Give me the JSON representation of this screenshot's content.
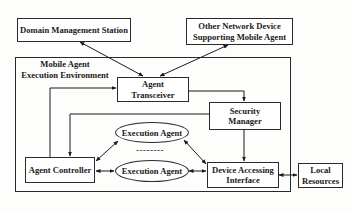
{
  "diagram": {
    "nodes": {
      "domain_management_station": {
        "label": "Domain Management Station"
      },
      "other_network_device": {
        "line1": "Other Network Device",
        "line2": "Supporting Mobile Agent"
      },
      "execution_environment": {
        "line1": "Mobile Agent",
        "line2": "Execution Environment"
      },
      "agent_transceiver": {
        "line1": "Agent",
        "line2": "Transceiver"
      },
      "security_manager": {
        "line1": "Security",
        "line2": "Manager"
      },
      "execution_agent_1": {
        "label": "Execution Agent"
      },
      "execution_agent_2": {
        "label": "Execution Agent"
      },
      "ellipsis": {
        "label": "--------"
      },
      "agent_controller": {
        "label": "Agent Controller"
      },
      "device_accessing_interface": {
        "line1": "Device Accessing",
        "line2": "Interface"
      },
      "local_resources": {
        "line1": "Local",
        "line2": "Resources"
      }
    },
    "edges": [
      {
        "from": "Domain Management Station",
        "to": "Agent Transceiver",
        "direction": "bidirectional"
      },
      {
        "from": "Other Network Device Supporting Mobile Agent",
        "to": "Agent Transceiver",
        "direction": "bidirectional"
      },
      {
        "from": "Agent Controller",
        "to": "Agent Transceiver",
        "direction": "forward"
      },
      {
        "from": "Agent Transceiver",
        "to": "Security Manager",
        "direction": "forward"
      },
      {
        "from": "Security Manager",
        "to": "Agent Controller",
        "direction": "forward"
      },
      {
        "from": "Security Manager",
        "to": "Device Accessing Interface",
        "direction": "forward"
      },
      {
        "from": "Agent Controller",
        "to": "Execution Agent (1)",
        "direction": "bidirectional"
      },
      {
        "from": "Agent Controller",
        "to": "Execution Agent (2)",
        "direction": "bidirectional"
      },
      {
        "from": "Execution Agent (1)",
        "to": "Device Accessing Interface",
        "direction": "bidirectional"
      },
      {
        "from": "Execution Agent (2)",
        "to": "Device Accessing Interface",
        "direction": "bidirectional"
      },
      {
        "from": "Device Accessing Interface",
        "to": "Local Resources",
        "direction": "bidirectional"
      }
    ]
  }
}
